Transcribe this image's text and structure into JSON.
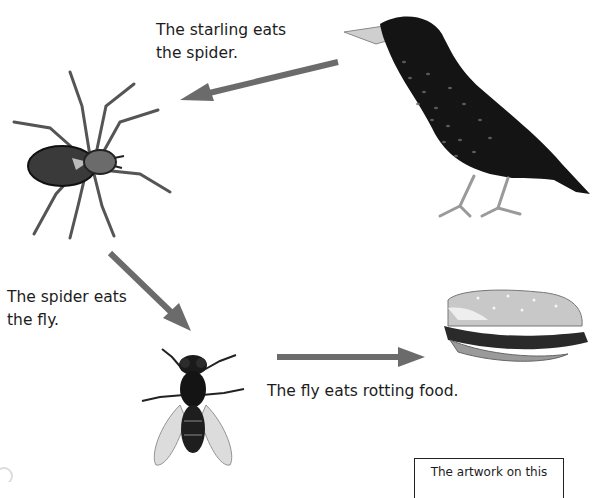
{
  "diagram": {
    "type": "food-chain",
    "arrow_color": "#6b6b6b",
    "nodes": [
      {
        "id": "starling",
        "name": "Starling",
        "icon": "starling-bird-icon"
      },
      {
        "id": "spider",
        "name": "Spider",
        "icon": "spider-icon"
      },
      {
        "id": "fly",
        "name": "Fly",
        "icon": "fly-icon"
      },
      {
        "id": "rotting-food",
        "name": "Rotting food (bitten sandwich)",
        "icon": "sandwich-icon"
      }
    ],
    "edges": [
      {
        "from": "starling",
        "to": "spider",
        "label_lines": [
          "The starling eats",
          "the spider."
        ]
      },
      {
        "from": "spider",
        "to": "fly",
        "label_lines": [
          "The spider eats",
          "the fly."
        ]
      },
      {
        "from": "fly",
        "to": "rotting-food",
        "label_lines": [
          "The fly eats rotting food."
        ]
      }
    ]
  },
  "labels": {
    "starling_eats_spider": {
      "line1": "The starling eats",
      "line2": "the spider."
    },
    "spider_eats_fly": {
      "line1": "The spider eats",
      "line2": "the fly."
    },
    "fly_eats_food": {
      "line1": "The fly eats rotting food."
    }
  },
  "note_box": {
    "text": "The artwork on this"
  }
}
